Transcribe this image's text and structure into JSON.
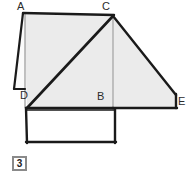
{
  "figure": {
    "number_label": "3",
    "background_color": "#ffffff",
    "fill_color": "#ebebeb",
    "stroke_color": "#1a1a1a",
    "thin_stroke_color": "#8f8f8f",
    "vertices": [
      {
        "name": "A",
        "label": "A",
        "x": 24,
        "y": 13
      },
      {
        "name": "C",
        "label": "C",
        "x": 113,
        "y": 15
      },
      {
        "name": "D",
        "label": "D",
        "x": 27,
        "y": 108
      },
      {
        "name": "B",
        "label": "B",
        "x": 113,
        "y": 108
      },
      {
        "name": "E",
        "label": "E",
        "x": 176,
        "y": 108
      }
    ],
    "shapes": {
      "upper_quadrilateral": {
        "name": "shaded-quadrilateral-ACBD",
        "points": "24,13 113,15 113,108 27,108",
        "filled": true
      },
      "right_shape": {
        "name": "shaded-shape-CEB",
        "points": "113,15 176,95 176,108 113,108",
        "filled": true
      },
      "left_sliver": {
        "name": "thin-sliver-left",
        "points": "24,13 14,89 25,89 25,13",
        "filled": false
      },
      "lower_rectangle": {
        "name": "open-rectangle-bottom",
        "points": "26,110 115,110 115,142 26,142",
        "filled": false
      }
    },
    "segments": [
      {
        "name": "segment-A-C",
        "x1": 24,
        "y1": 13,
        "x2": 113,
        "y2": 15,
        "weight": "heavy"
      },
      {
        "name": "segment-C-D",
        "x1": 113,
        "y1": 15,
        "x2": 27,
        "y2": 108,
        "weight": "heavy"
      },
      {
        "name": "segment-D-B",
        "x1": 27,
        "y1": 108,
        "x2": 113,
        "y2": 108,
        "weight": "heavy"
      },
      {
        "name": "segment-B-E",
        "x1": 113,
        "y1": 108,
        "x2": 176,
        "y2": 108,
        "weight": "heavy"
      },
      {
        "name": "segment-C-E-upper",
        "x1": 113,
        "y1": 15,
        "x2": 176,
        "y2": 95,
        "weight": "heavy"
      },
      {
        "name": "segment-E-vertical",
        "x1": 176,
        "y1": 95,
        "x2": 176,
        "y2": 108,
        "weight": "heavy"
      },
      {
        "name": "segment-C-B-altitude",
        "x1": 113,
        "y1": 15,
        "x2": 113,
        "y2": 108,
        "weight": "light"
      },
      {
        "name": "segment-A-sliver-down",
        "x1": 24,
        "y1": 13,
        "x2": 14,
        "y2": 89,
        "weight": "heavy"
      },
      {
        "name": "segment-sliver-base",
        "x1": 14,
        "y1": 89,
        "x2": 25,
        "y2": 89,
        "weight": "heavy"
      },
      {
        "name": "segment-A-left-edge",
        "x1": 25,
        "y1": 13,
        "x2": 25,
        "y2": 108,
        "weight": "light"
      },
      {
        "name": "segment-rect-left",
        "x1": 26,
        "y1": 108,
        "x2": 26,
        "y2": 142,
        "weight": "heavy"
      },
      {
        "name": "segment-rect-bottom",
        "x1": 26,
        "y1": 142,
        "x2": 115,
        "y2": 142,
        "weight": "heavy"
      },
      {
        "name": "segment-rect-right",
        "x1": 115,
        "y1": 110,
        "x2": 115,
        "y2": 142,
        "weight": "heavy"
      },
      {
        "name": "segment-rect-top",
        "x1": 26,
        "y1": 110,
        "x2": 115,
        "y2": 110,
        "weight": "heavy"
      }
    ]
  }
}
